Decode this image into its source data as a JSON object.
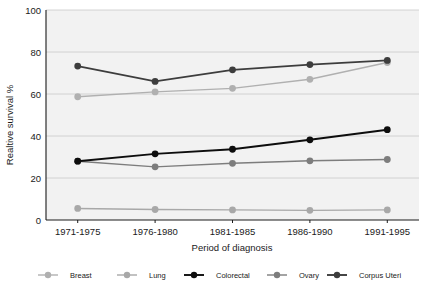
{
  "chart_data": {
    "type": "line",
    "title": "",
    "xlabel": "Period of diagnosis",
    "ylabel": "Realtive survival %",
    "categories": [
      "1971-1975",
      "1976-1980",
      "1981-1985",
      "1986-1990",
      "1991-1995"
    ],
    "yticks": [
      0,
      20,
      40,
      60,
      80,
      100
    ],
    "ylim": [
      0,
      100
    ],
    "grid": true,
    "legend_position": "bottom",
    "series": [
      {
        "name": "Breast",
        "color": "#b0b0b0",
        "values": [
          58.7,
          61.0,
          62.7,
          67.0,
          75.0
        ]
      },
      {
        "name": "Lung",
        "color": "#a8a8a8",
        "values": [
          5.5,
          5.0,
          4.8,
          4.6,
          4.8
        ]
      },
      {
        "name": "Colorectal",
        "color": "#0d0d0d",
        "values": [
          28.0,
          31.5,
          33.7,
          38.2,
          43.0
        ]
      },
      {
        "name": "Ovary",
        "color": "#7d7d7d",
        "values": [
          28.0,
          25.3,
          27.0,
          28.2,
          28.8
        ]
      },
      {
        "name": "Corpus Uteri",
        "color": "#3d3d3d",
        "values": [
          73.3,
          66.0,
          71.5,
          74.0,
          76.0
        ]
      }
    ]
  },
  "axis": {
    "y_tick_0": "0",
    "y_tick_20": "20",
    "y_tick_40": "40",
    "y_tick_60": "60",
    "y_tick_80": "80",
    "y_tick_100": "100"
  },
  "legend": {
    "items": [
      {
        "label": "Breast"
      },
      {
        "label": "Lung"
      },
      {
        "label": "Colorectal"
      },
      {
        "label": "Ovary"
      },
      {
        "label": "Corpus Uteri"
      }
    ]
  },
  "header": {
    "clipped_title": ""
  }
}
